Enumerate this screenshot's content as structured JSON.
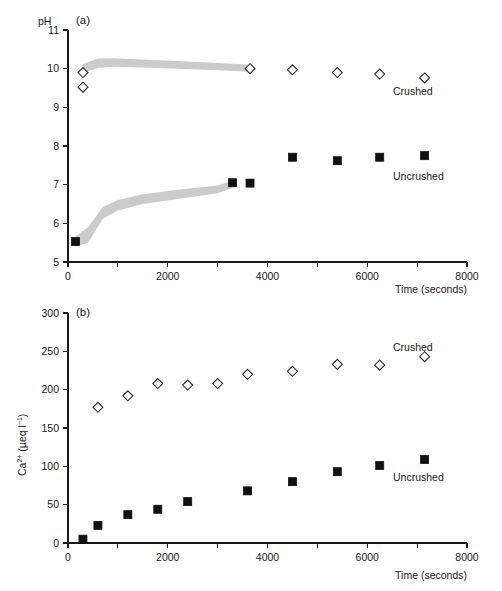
{
  "figure": {
    "background": "#ffffff",
    "foreground": "#1a1a1a",
    "band_color": "#b9b9b9",
    "marker_open_fill": "#ffffff",
    "marker_filled_fill": "#111111"
  },
  "panel_a": {
    "letter": "(a)",
    "ylabel": "pH",
    "xlabel": "Time (seconds)",
    "series_label_crushed": "Crushed",
    "series_label_uncrushed": "Uncrushed",
    "ytick_labels": [
      "5",
      "6",
      "7",
      "8",
      "9",
      "10",
      "11"
    ],
    "xtick_labels": [
      "0",
      "2000",
      "4000",
      "6000",
      "8000"
    ]
  },
  "panel_b": {
    "letter": "(b)",
    "ylabel_main": "Ca",
    "ylabel_charge": "2+",
    "ylabel_unit_open": " (µeq l",
    "ylabel_unit_exp": "−1",
    "ylabel_unit_close": ")",
    "xlabel": "Time (seconds)",
    "series_label_crushed": "Crushed",
    "series_label_uncrushed": "Uncrushed",
    "ytick_labels": [
      "0",
      "50",
      "100",
      "150",
      "200",
      "250",
      "300"
    ],
    "xtick_labels": [
      "0",
      "2000",
      "4000",
      "6000",
      "8000"
    ]
  },
  "chart_data": [
    {
      "type": "scatter",
      "panel": "(a)",
      "title": "pH versus time for crushed and uncrushed rock",
      "xlabel": "Time (seconds)",
      "ylabel": "pH",
      "xlim": [
        0,
        8000
      ],
      "ylim": [
        5,
        11
      ],
      "xticks": [
        0,
        1000,
        2000,
        3000,
        4000,
        5000,
        6000,
        7000,
        8000
      ],
      "xticklabels": [
        "0",
        "",
        "2000",
        "",
        "4000",
        "",
        "6000",
        "",
        "8000"
      ],
      "yticks": [
        5,
        6,
        7,
        8,
        9,
        10,
        11
      ],
      "grid": false,
      "legend": "inline-annotations",
      "series": [
        {
          "name": "Crushed",
          "marker": "open-diamond",
          "x": [
            300,
            300,
            3650,
            4500,
            5400,
            6250,
            7150
          ],
          "y": [
            9.9,
            9.52,
            10.0,
            9.97,
            9.9,
            9.86,
            9.76
          ]
        },
        {
          "name": "Uncrushed",
          "marker": "filled-square",
          "x": [
            150,
            3300,
            3650,
            4500,
            5400,
            6250,
            7150
          ],
          "y": [
            5.53,
            7.05,
            7.04,
            7.71,
            7.62,
            7.71,
            7.75
          ]
        }
      ],
      "shaded_bands": [
        {
          "name": "crushed-envelope",
          "x": [
            300,
            600,
            900,
            1500,
            2200,
            3000,
            3650
          ],
          "y_upper": [
            10.12,
            10.26,
            10.27,
            10.24,
            10.2,
            10.15,
            10.1
          ],
          "y_lower": [
            9.9,
            10.02,
            10.05,
            10.03,
            10.0,
            9.96,
            9.92
          ]
        },
        {
          "name": "uncrushed-envelope",
          "x": [
            150,
            400,
            700,
            1000,
            1500,
            2200,
            3000,
            3300
          ],
          "y_upper": [
            5.66,
            5.9,
            6.42,
            6.6,
            6.75,
            6.87,
            6.98,
            7.1
          ],
          "y_lower": [
            5.4,
            5.5,
            6.12,
            6.33,
            6.5,
            6.63,
            6.78,
            6.92
          ]
        }
      ]
    },
    {
      "type": "scatter",
      "panel": "(b)",
      "title": "Calcium concentration versus time for crushed and uncrushed rock",
      "xlabel": "Time (seconds)",
      "ylabel": "Ca2+ (µeq l-1)",
      "xlim": [
        0,
        8000
      ],
      "ylim": [
        0,
        300
      ],
      "xticks": [
        0,
        1000,
        2000,
        3000,
        4000,
        5000,
        6000,
        7000,
        8000
      ],
      "xticklabels": [
        "0",
        "",
        "2000",
        "",
        "4000",
        "",
        "6000",
        "",
        "8000"
      ],
      "yticks": [
        0,
        50,
        100,
        150,
        200,
        250,
        300
      ],
      "grid": false,
      "legend": "inline-annotations",
      "series": [
        {
          "name": "Crushed",
          "marker": "open-diamond",
          "x": [
            600,
            1200,
            1800,
            2400,
            3000,
            3600,
            4500,
            5400,
            6250,
            7150
          ],
          "y": [
            177,
            192,
            208,
            206,
            208,
            220,
            224,
            233,
            232,
            243
          ]
        },
        {
          "name": "Uncrushed",
          "marker": "filled-square",
          "x": [
            300,
            600,
            1200,
            1800,
            2400,
            3600,
            4500,
            5400,
            6250,
            7150
          ],
          "y": [
            5,
            23,
            37,
            44,
            54,
            68,
            80,
            93,
            101,
            109
          ]
        }
      ]
    }
  ]
}
